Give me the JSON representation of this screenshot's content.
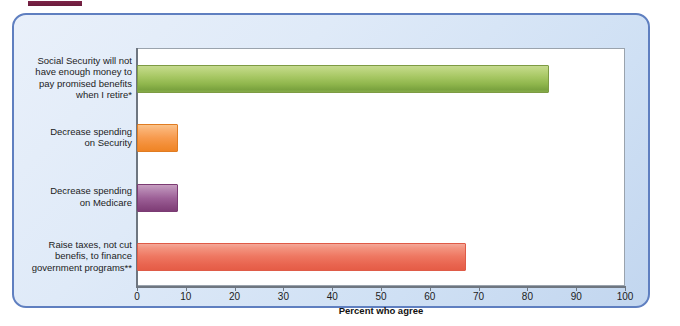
{
  "figure": {
    "panel_border_color": "#5f7fc0",
    "panel_background": "#dfeaf8",
    "top_rule_color": "#7d2448"
  },
  "chart_data": {
    "type": "bar",
    "orientation": "horizontal",
    "title": "",
    "xlabel": "Percent who agree",
    "ylabel": "",
    "xlim": [
      0,
      100
    ],
    "xticks": [
      0,
      10,
      20,
      30,
      40,
      50,
      60,
      70,
      80,
      90,
      100
    ],
    "grid": false,
    "legend": "none",
    "categories": [
      "Social Security will not\nhave enough money to\npay promised benefits\nwhen I retire*",
      "Decrease spending\non Security",
      "Decrease spending\non Medicare",
      "Raise taxes, not cut\nbenefis, to finance\ngovernment programs**"
    ],
    "values": [
      84,
      8,
      8,
      67
    ],
    "bar_colors": [
      "#8fb64c",
      "#f28c33",
      "#9c5f96",
      "#ee7761"
    ]
  }
}
